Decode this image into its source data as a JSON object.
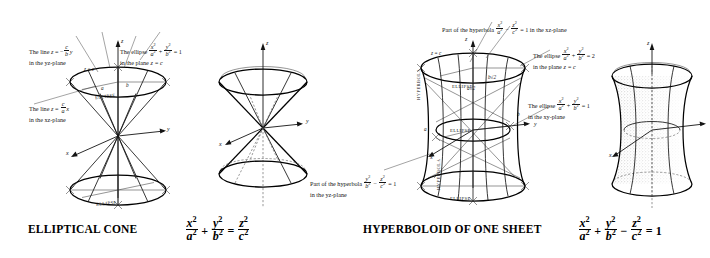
{
  "figure": {
    "kind": "quadric-surfaces-plate",
    "panels": [
      {
        "id": "elliptical-cone",
        "caption": "ELLIPTICAL CONE",
        "equation_text": "x^2/a^2 + y^2/b^2 = z^2/c^2",
        "equation_parts": {
          "t1_num": "x",
          "t1_den": "a",
          "op1": "+",
          "t2_num": "y",
          "t2_den": "b",
          "op2": "=",
          "t3_num": "z",
          "t3_den": "c",
          "exp": "2"
        },
        "annotations": [
          {
            "name": "line-yz-plane",
            "line1_pre": "The line ",
            "line1_var": "z",
            "line1_eq": " = −",
            "line1_frac_num": "c",
            "line1_frac_den": "b",
            "line1_post": "y",
            "line2": "in the yz-plane"
          },
          {
            "name": "ellipse-plane-z-equals-c",
            "line1_pre": "The ellipse ",
            "f1_num": "x",
            "f1_den": "a",
            "op": "+",
            "f2_num": "y",
            "f2_den": "b",
            "rhs": " = 1",
            "line2_pre": "in the plane ",
            "line2_var": "z",
            "line2_post": " = c"
          },
          {
            "name": "line-xz-plane",
            "line1_pre": "The line ",
            "line1_var": "z",
            "line1_eq": " = ",
            "line1_frac_num": "c",
            "line1_frac_den": "a",
            "line1_post": "x",
            "line2": "in the xz-plane"
          }
        ],
        "axis_labels": [
          "z",
          "y",
          "x"
        ],
        "plane_label": "z = c",
        "semi_axis_labels": [
          "a",
          "b"
        ],
        "trace_labels": [
          "ELLIPSE",
          "ELLIPSE"
        ]
      },
      {
        "id": "hyperboloid-of-one-sheet",
        "caption": "HYPERBOLOID OF ONE SHEET",
        "equation_text": "x^2/a^2 + y^2/b^2 − z^2/c^2 = 1",
        "equation_parts": {
          "t1_num": "x",
          "t1_den": "a",
          "op1": "+",
          "t2_num": "y",
          "t2_den": "b",
          "op2": "−",
          "t3_num": "z",
          "t3_den": "c",
          "op3": "=",
          "rhs": "1",
          "exp": "2"
        },
        "annotations": [
          {
            "name": "hyperbola-xz-plane",
            "pre": "Part of the hyperbola ",
            "f1_num": "x",
            "f1_den": "a",
            "op": "−",
            "f2_num": "z",
            "f2_den": "c",
            "post": " = 1 in the xz-plane"
          },
          {
            "name": "ellipse-plane-z-equals-c",
            "line1_pre": "The ellipse ",
            "f1_num": "x",
            "f1_den": "a",
            "op": "+",
            "f2_num": "y",
            "f2_den": "b",
            "rhs": " = 2",
            "line2_pre": "in the plane ",
            "line2_var": "z",
            "line2_post": " = c"
          },
          {
            "name": "ellipse-xy-plane",
            "line1_pre": "The ellipse ",
            "f1_num": "x",
            "f1_den": "a",
            "op": "+",
            "f2_num": "y",
            "f2_den": "b",
            "rhs": " = 1",
            "line2": "in the xy-plane"
          },
          {
            "name": "hyperbola-yz-plane",
            "pre": "Part of the hyperbola ",
            "f1_num": "y",
            "f1_den": "b",
            "op": "−",
            "f2_num": "z",
            "f2_den": "c",
            "rhs": " = 1",
            "line2": "in the yz-plane"
          }
        ],
        "axis_labels": [
          "z",
          "y",
          "x"
        ],
        "plane_label": "z = c",
        "semi_axis_labels": [
          "a",
          "b"
        ],
        "scaled_axis_labels": [
          "a√2",
          "b√2"
        ],
        "trace_labels": [
          "ELLIPSE",
          "ELLIPSE",
          "ELLIPSE",
          "HYPERBOLA",
          "HYPERBOLA"
        ]
      }
    ],
    "colors": {
      "ink": "#141414",
      "paper": "#ffffff",
      "hidden_line": "#555555",
      "shading": "#8a8a8a"
    }
  }
}
